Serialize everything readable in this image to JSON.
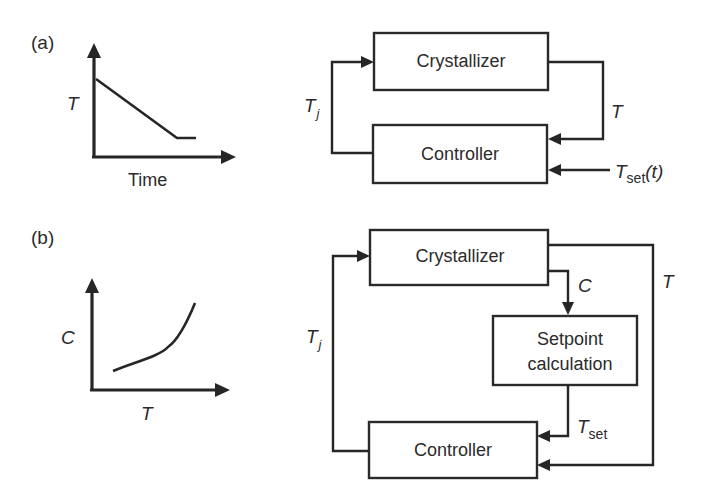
{
  "figure": {
    "panel_a": {
      "label": "(a)",
      "graph": {
        "y_axis_label": "T",
        "x_axis_label": "Time",
        "description": "Temperature decreases linearly with time then levels off"
      },
      "blocks": {
        "crystallizer": "Crystallizer",
        "controller": "Controller"
      },
      "signals": {
        "jacket_temp": "T",
        "jacket_temp_sub": "j",
        "temp": "T",
        "setpoint": "T",
        "setpoint_sub": "set",
        "setpoint_arg": "(t)"
      }
    },
    "panel_b": {
      "label": "(b)",
      "graph": {
        "y_axis_label": "C",
        "x_axis_label": "T",
        "description": "Concentration increases nonlinearly with temperature (solubility curve)"
      },
      "blocks": {
        "crystallizer": "Crystallizer",
        "setpoint_line1": "Setpoint",
        "setpoint_line2": "calculation",
        "controller": "Controller"
      },
      "signals": {
        "jacket_temp": "T",
        "jacket_temp_sub": "j",
        "concentration": "C",
        "temp": "T",
        "setpoint": "T",
        "setpoint_sub": "set"
      }
    }
  }
}
